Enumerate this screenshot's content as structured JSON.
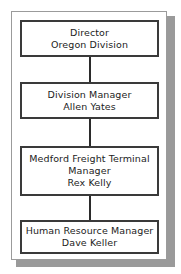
{
  "chart_data": {
    "type": "diagram",
    "diagram_kind": "organizational-chart",
    "orientation": "vertical-chain",
    "title": "",
    "nodes": [
      {
        "id": "node-1",
        "lines": [
          "Director",
          "Oregon Division"
        ],
        "title": "Director",
        "subtitle": "Oregon Division",
        "level": 1
      },
      {
        "id": "node-2",
        "lines": [
          "Division Manager",
          "Allen Yates"
        ],
        "title": "Division Manager",
        "subtitle": "Allen Yates",
        "level": 2
      },
      {
        "id": "node-3",
        "lines": [
          "Medford Freight Terminal",
          "Manager",
          "Rex Kelly"
        ],
        "title": "Medford Freight Terminal Manager",
        "subtitle": "Rex Kelly",
        "level": 3
      },
      {
        "id": "node-4",
        "lines": [
          "Human Resource Manager",
          "Dave Keller"
        ],
        "title": "Human Resource Manager",
        "subtitle": "Dave Keller",
        "level": 4
      }
    ],
    "edges": [
      {
        "from": "node-1",
        "to": "node-2"
      },
      {
        "from": "node-2",
        "to": "node-3"
      },
      {
        "from": "node-3",
        "to": "node-4"
      }
    ],
    "colors": {
      "page_background": "#ffffff",
      "card_background": "#ffffff",
      "card_border": "#9b9b9b",
      "card_shadow": "#9a9a9a",
      "box_border": "#3a3a3a",
      "box_fill": "#ffffff",
      "connector": "#2b2b2b",
      "text": "#1c1c1c"
    }
  }
}
